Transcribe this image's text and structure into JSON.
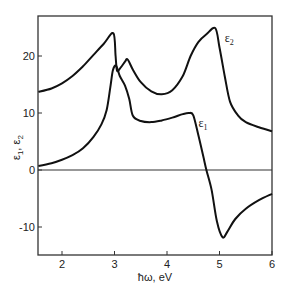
{
  "chart_data": {
    "type": "line",
    "title": "",
    "xlabel": "ħω, eV",
    "ylabel": "ε1, ε2",
    "xlim": [
      1.55,
      6
    ],
    "ylim": [
      -15,
      27
    ],
    "xticks": [
      2,
      3,
      4,
      5,
      6
    ],
    "yticks": [
      -10,
      0,
      10,
      20
    ],
    "xtick_labels": [
      "2",
      "3",
      "4",
      "5",
      "6"
    ],
    "ytick_labels": [
      "-10",
      "0",
      "10",
      "20"
    ],
    "grid": false,
    "zero_line": true,
    "series": [
      {
        "name": "ε2",
        "label": "ε2",
        "x": [
          1.55,
          1.8,
          2.0,
          2.2,
          2.4,
          2.6,
          2.8,
          2.98,
          3.02,
          3.05,
          3.12,
          3.2,
          3.25,
          3.35,
          3.5,
          3.7,
          3.9,
          4.1,
          4.3,
          4.45,
          4.6,
          4.75,
          4.92,
          5.0,
          5.1,
          5.2,
          5.35,
          5.5,
          5.75,
          6.0
        ],
        "y": [
          13.7,
          14.3,
          15.2,
          16.5,
          18.2,
          20.2,
          22.2,
          24.0,
          20.0,
          17.4,
          18.0,
          19.0,
          19.4,
          17.6,
          15.4,
          13.8,
          13.3,
          14.0,
          16.5,
          20.0,
          22.5,
          23.8,
          24.9,
          21.5,
          16.5,
          12.0,
          9.6,
          8.4,
          7.5,
          6.8
        ]
      },
      {
        "name": "ε1",
        "label": "ε1",
        "x": [
          1.55,
          1.8,
          2.0,
          2.2,
          2.4,
          2.6,
          2.75,
          2.85,
          2.92,
          2.97,
          3.03,
          3.1,
          3.2,
          3.28,
          3.35,
          3.5,
          3.7,
          3.9,
          4.1,
          4.3,
          4.42,
          4.5,
          4.6,
          4.7,
          4.75,
          4.85,
          4.95,
          5.06,
          5.15,
          5.3,
          5.5,
          5.75,
          6.0
        ],
        "y": [
          0.7,
          1.2,
          1.8,
          2.6,
          3.8,
          5.8,
          8.0,
          10.5,
          14.5,
          17.5,
          18.3,
          16.5,
          14.8,
          12.5,
          9.5,
          8.6,
          8.4,
          8.7,
          9.2,
          9.8,
          10.0,
          9.6,
          6.0,
          2.0,
          0.0,
          -3.5,
          -9.0,
          -11.8,
          -10.8,
          -8.6,
          -6.8,
          -5.3,
          -4.2
        ]
      }
    ],
    "annotations": [
      {
        "text": "ε",
        "sub": "2",
        "x": 5.1,
        "y": 22.5,
        "series": "ε2"
      },
      {
        "text": "ε",
        "sub": "1",
        "x": 4.6,
        "y": 7.5,
        "series": "ε1"
      }
    ],
    "legend": "none"
  }
}
